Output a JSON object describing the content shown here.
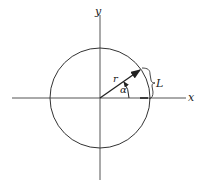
{
  "diagram": {
    "type": "polar-coordinates-circle",
    "labels": {
      "x_axis": "x",
      "y_axis": "y",
      "radius": "r",
      "angle": "α",
      "arc_length": "L"
    },
    "geometry": {
      "center": [
        100,
        98
      ],
      "radius_px": 50,
      "angle_deg": 35
    },
    "colors": {
      "stroke": "#333333",
      "text": "#1a1a1a",
      "background": "#ffffff"
    }
  }
}
